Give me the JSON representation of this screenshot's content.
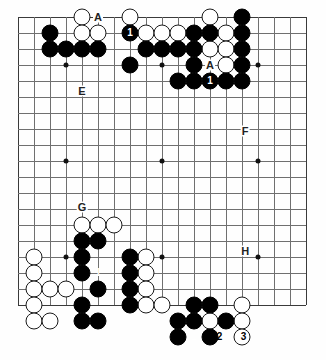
{
  "diagram": {
    "kind": "go-board-diagram",
    "board_size": 19,
    "origin_x": 18,
    "origin_y": 17,
    "cell": 16,
    "stone_radius": 8.5,
    "colors": {
      "black": "#000000",
      "white": "#ffffff",
      "line": "#6f6f6f",
      "edge": "#3a3a3a",
      "background": "#fefefe"
    },
    "hoshi": [
      [
        3,
        3
      ],
      [
        9,
        3
      ],
      [
        15,
        3
      ],
      [
        3,
        9
      ],
      [
        9,
        9
      ],
      [
        15,
        9
      ],
      [
        3,
        15
      ],
      [
        9,
        15
      ],
      [
        15,
        15
      ]
    ],
    "stones": [
      {
        "c": "w",
        "x": 4,
        "y": 0
      },
      {
        "c": "w",
        "x": 7,
        "y": 0
      },
      {
        "c": "w",
        "x": 12,
        "y": 0
      },
      {
        "c": "b",
        "x": 14,
        "y": 0
      },
      {
        "c": "w",
        "x": 2,
        "y": 1
      },
      {
        "c": "b",
        "x": 2,
        "y": 1,
        "skip": true
      },
      {
        "c": "b",
        "x": 7,
        "y": 1,
        "label": "1"
      },
      {
        "c": "b",
        "x": 14,
        "y": 1
      }
    ],
    "black_stones": [
      [
        2,
        1
      ],
      [
        7,
        1
      ],
      [
        14,
        0
      ],
      [
        14,
        1
      ],
      [
        2,
        2
      ],
      [
        3,
        2
      ],
      [
        4,
        2
      ],
      [
        5,
        2
      ],
      [
        8,
        2
      ],
      [
        9,
        2
      ],
      [
        10,
        2
      ],
      [
        7,
        3
      ],
      [
        11,
        1
      ],
      [
        12,
        1
      ],
      [
        10,
        4
      ],
      [
        11,
        4
      ],
      [
        12,
        4
      ],
      [
        13,
        4
      ],
      [
        11,
        2
      ],
      [
        11,
        3
      ],
      [
        14,
        2
      ],
      [
        14,
        3
      ],
      [
        14,
        4
      ],
      [
        4,
        14
      ],
      [
        5,
        14
      ],
      [
        4,
        15
      ],
      [
        7,
        15
      ],
      [
        4,
        16
      ],
      [
        7,
        16
      ],
      [
        5,
        17
      ],
      [
        7,
        17
      ],
      [
        4,
        18
      ],
      [
        7,
        18
      ],
      [
        4,
        19
      ],
      [
        5,
        19
      ],
      [
        11,
        18
      ],
      [
        12,
        18
      ],
      [
        10,
        19
      ],
      [
        11,
        19
      ],
      [
        13,
        19
      ],
      [
        10,
        20
      ],
      [
        12,
        20
      ]
    ],
    "white_stones": [
      [
        4,
        0
      ],
      [
        7,
        0
      ],
      [
        12,
        0
      ],
      [
        4,
        1
      ],
      [
        5,
        1
      ],
      [
        8,
        1
      ],
      [
        9,
        1
      ],
      [
        10,
        1
      ],
      [
        13,
        1
      ],
      [
        13,
        2
      ],
      [
        12,
        2
      ],
      [
        13,
        3
      ],
      [
        1,
        15
      ],
      [
        1,
        16
      ],
      [
        1,
        17
      ],
      [
        1,
        18
      ],
      [
        1,
        19
      ],
      [
        4,
        13
      ],
      [
        5,
        13
      ],
      [
        6,
        13
      ],
      [
        8,
        15
      ],
      [
        8,
        16
      ],
      [
        8,
        17
      ],
      [
        8,
        18
      ],
      [
        2,
        17
      ],
      [
        3,
        17
      ],
      [
        2,
        19
      ],
      [
        12,
        19
      ],
      [
        9,
        18
      ],
      [
        14,
        18
      ],
      [
        14,
        19
      ],
      [
        14,
        20
      ]
    ],
    "labels": [
      {
        "text": "A",
        "x": 5,
        "y": 0,
        "name": "point-label-a-top-left"
      },
      {
        "text": "A",
        "x": 12,
        "y": 3,
        "name": "point-label-a-top-right"
      },
      {
        "text": "E",
        "x": 4,
        "y": 4.6,
        "name": "point-label-e"
      },
      {
        "text": "F",
        "x": 14.2,
        "y": 7.1,
        "name": "point-label-f"
      },
      {
        "text": "G",
        "x": 4,
        "y": 11.9,
        "name": "point-label-g"
      },
      {
        "text": "H",
        "x": 14.2,
        "y": 14.6,
        "name": "point-label-h"
      }
    ],
    "move_numbers": [
      {
        "text": "1",
        "x": 7,
        "y": 1,
        "color": "white",
        "name": "move-marker-1-top-left"
      },
      {
        "text": "1",
        "x": 12,
        "y": 4,
        "color": "white",
        "name": "move-marker-1-top-right"
      },
      {
        "text": "1",
        "x": 5,
        "y": 16,
        "color": "white",
        "name": "move-marker-1-bottom-left"
      },
      {
        "text": "1",
        "x": 11,
        "y": 20,
        "color": "white",
        "name": "move-marker-1-bottom-right"
      },
      {
        "text": "2",
        "x": 12.6,
        "y": 20,
        "color": "black",
        "name": "move-marker-2-bottom-right"
      },
      {
        "text": "3",
        "x": 14.1,
        "y": 20,
        "color": "black",
        "name": "move-marker-3-bottom-right"
      }
    ]
  }
}
